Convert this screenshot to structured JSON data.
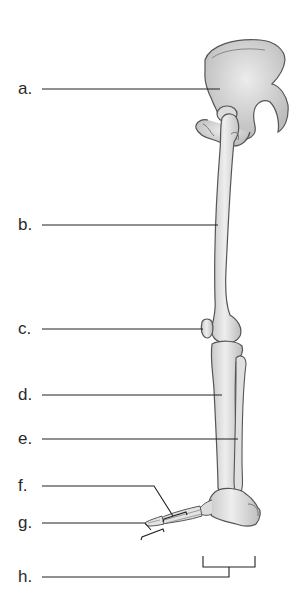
{
  "diagram": {
    "labels": [
      {
        "key": "a",
        "text": "a.",
        "y": 89,
        "target": "hip bone (os coxae)"
      },
      {
        "key": "b",
        "text": "b.",
        "y": 225,
        "target": "femur"
      },
      {
        "key": "c",
        "text": "c.",
        "y": 329,
        "target": "patella"
      },
      {
        "key": "d",
        "text": "d.",
        "y": 395,
        "target": "tibia"
      },
      {
        "key": "e",
        "text": "e.",
        "y": 439,
        "target": "fibula"
      },
      {
        "key": "f",
        "text": "f.",
        "y": 486,
        "target": "metatarsals"
      },
      {
        "key": "g",
        "text": "g.",
        "y": 523,
        "target": "phalanges"
      },
      {
        "key": "h",
        "text": "h.",
        "y": 577,
        "target": "tarsals"
      }
    ],
    "colors": {
      "bone_fill": "#e9e9e9",
      "bone_shade": "#c8c8c8",
      "bone_outline": "#555555",
      "leader_line": "#222222",
      "label_text": "#2a2a2a",
      "background": "#ffffff"
    }
  }
}
